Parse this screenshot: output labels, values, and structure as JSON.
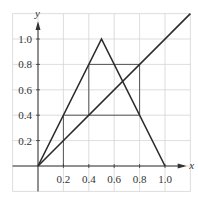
{
  "chart_data": {
    "type": "line",
    "title": "",
    "xlabel": "x",
    "ylabel": "y",
    "xlim": [
      -0.2,
      1.2
    ],
    "ylim": [
      -0.2,
      1.2
    ],
    "grid": true,
    "legend": null,
    "x_ticks": [
      "0.2",
      "0.4",
      "0.6",
      "0.8",
      "1.0"
    ],
    "y_ticks": [
      "0.2",
      "0.4",
      "0.6",
      "0.8",
      "1.0"
    ],
    "series": [
      {
        "name": "tent map",
        "x": [
          0,
          0.5,
          1.0
        ],
        "y": [
          0,
          1.0,
          0
        ]
      },
      {
        "name": "y = x",
        "x": [
          0,
          1.2
        ],
        "y": [
          0,
          1.2
        ]
      },
      {
        "name": "cobweb",
        "x": [
          0.2,
          0.2,
          0.4,
          0.4,
          0.8,
          0.8,
          0.4,
          0.4,
          0.2
        ],
        "y": [
          0,
          0.4,
          0.4,
          0.8,
          0.8,
          0.4,
          0.4,
          0.8,
          0.4
        ],
        "segments": [
          [
            [
              0.2,
              0
            ],
            [
              0.2,
              0.4
            ]
          ],
          [
            [
              0.2,
              0.4
            ],
            [
              0.8,
              0.4
            ]
          ],
          [
            [
              0.4,
              0.4
            ],
            [
              0.4,
              0.8
            ]
          ],
          [
            [
              0.4,
              0.8
            ],
            [
              0.8,
              0.8
            ]
          ],
          [
            [
              0.8,
              0.4
            ],
            [
              0.8,
              0.8
            ]
          ]
        ]
      }
    ]
  },
  "colors": {
    "grid": "#d4d4d4",
    "axis": "#333333",
    "curve": "#2b2b2b",
    "cobweb": "#555555"
  }
}
